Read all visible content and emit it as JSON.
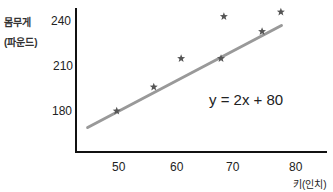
{
  "chart_data": {
    "type": "scatter",
    "title": "",
    "xlabel": "키(인치)",
    "ylabel": [
      "몸무게",
      "(파운드)"
    ],
    "x_ticks": [
      50,
      60,
      70,
      80
    ],
    "y_ticks": [
      180,
      210,
      240
    ],
    "xlim": [
      43,
      83
    ],
    "ylim": [
      154,
      260
    ],
    "grid": false,
    "legend": null,
    "series": [
      {
        "name": "data",
        "marker": "star",
        "color": "#555555",
        "points": [
          {
            "x": 49.6,
            "y": 180
          },
          {
            "x": 56.1,
            "y": 196
          },
          {
            "x": 60.9,
            "y": 215
          },
          {
            "x": 67.9,
            "y": 215
          },
          {
            "x": 68.4,
            "y": 243
          },
          {
            "x": 75.1,
            "y": 233
          },
          {
            "x": 78.4,
            "y": 246
          }
        ]
      }
    ],
    "fit_line": {
      "equation": "y = 2x + 80",
      "slope": 2,
      "intercept": 80,
      "x_range": [
        44.5,
        78.5
      ],
      "color": "#999999"
    },
    "annotations": [
      {
        "text": "y = 2x + 80"
      }
    ]
  },
  "labels": {
    "y_title_1": "몸무게",
    "y_title_2": "(파운드)",
    "x_title": "키(인치)",
    "equation": "y = 2x + 80",
    "y_ticks": [
      "240",
      "210",
      "180"
    ],
    "x_ticks": [
      "50",
      "60",
      "70",
      "80"
    ]
  }
}
